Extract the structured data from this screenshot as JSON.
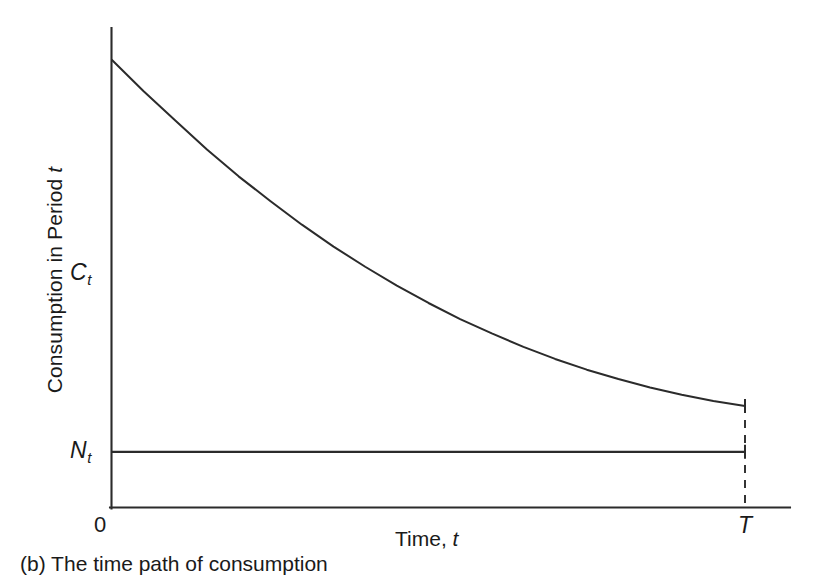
{
  "figure": {
    "caption": "(b) The time path of consumption"
  },
  "axes": {
    "y_title_main": "Consumption in Period ",
    "y_title_italic": "t",
    "x_title_main": "Time, ",
    "x_title_italic": "t",
    "origin_label": "0",
    "x_end_label": "T",
    "series_label_consumption_base": "C",
    "series_label_consumption_sub": "t",
    "series_label_income_base": "N",
    "series_label_income_sub": "t"
  },
  "colors": {
    "background": "#ffffff",
    "ink": "#2b2b2b",
    "text": "#1a1a1a"
  },
  "chart_data": {
    "type": "line",
    "title": "(b) The time path of consumption",
    "xlabel": "Time, t",
    "ylabel": "Consumption in Period t",
    "grid": false,
    "legend": "none",
    "xlim": [
      0,
      1
    ],
    "ylim": [
      0,
      1
    ],
    "x_tick_labels": [
      "0",
      "T"
    ],
    "y_tick_labels": [
      "N_t",
      "C_t"
    ],
    "annotations": [
      "Vertical dashed line dropped from the end of the consumption path at t = T",
      "C_t declines exponentially from its initial level toward N_t",
      "N_t is constant over the whole interval from 0 to T"
    ],
    "series": [
      {
        "name": "C_t",
        "style": "solid",
        "description": "Consumption path: convex, monotonically decreasing from a high initial value at t=0 toward but still above N_t at t=T",
        "x": [
          0.0,
          0.05,
          0.1,
          0.15,
          0.2,
          0.25,
          0.3,
          0.35,
          0.4,
          0.45,
          0.5,
          0.55,
          0.6,
          0.65,
          0.7,
          0.75,
          0.8,
          0.85,
          0.9,
          0.95,
          1.0
        ],
        "y": [
          1.0,
          0.93,
          0.865,
          0.8,
          0.74,
          0.685,
          0.632,
          0.583,
          0.538,
          0.496,
          0.457,
          0.421,
          0.389,
          0.359,
          0.332,
          0.308,
          0.287,
          0.268,
          0.252,
          0.238,
          0.227
        ]
      },
      {
        "name": "N_t",
        "style": "solid",
        "description": "Constant labour income / endowment line",
        "x": [
          0.0,
          1.0
        ],
        "y": [
          0.1245,
          0.1245
        ]
      }
    ]
  }
}
